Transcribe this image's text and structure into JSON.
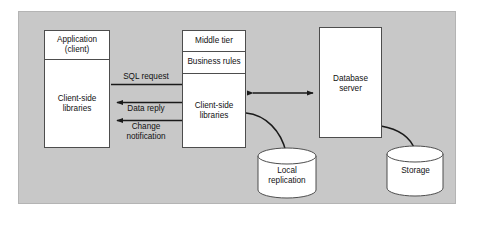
{
  "diagram": {
    "background_color": "#ffffff",
    "panel_color": "#c8c8c8",
    "node_fill": "#ffffff",
    "stroke_color": "#4d4d4d",
    "text_color": "#111111",
    "nodes": {
      "client": {
        "title_line_1": "Application",
        "title_line_2": "(client)",
        "body_line_1": "Client-side",
        "body_line_2": "libraries"
      },
      "middle_tier": {
        "title": "Middle tier",
        "rules": "Business rules",
        "body_line_1": "Client-side",
        "body_line_2": "libraries"
      },
      "database_server": {
        "line_1": "Database",
        "line_2": "server"
      },
      "local_replication": {
        "line_1": "Local",
        "line_2": "replication"
      },
      "storage": {
        "line_1": "Storage"
      }
    },
    "edges": {
      "sql_request": "SQL request",
      "data_reply": "Data reply",
      "change_notification_line_1": "Change",
      "change_notification_line_2": "notification",
      "db_link": "",
      "local_replication_link": "",
      "storage_link": ""
    }
  }
}
